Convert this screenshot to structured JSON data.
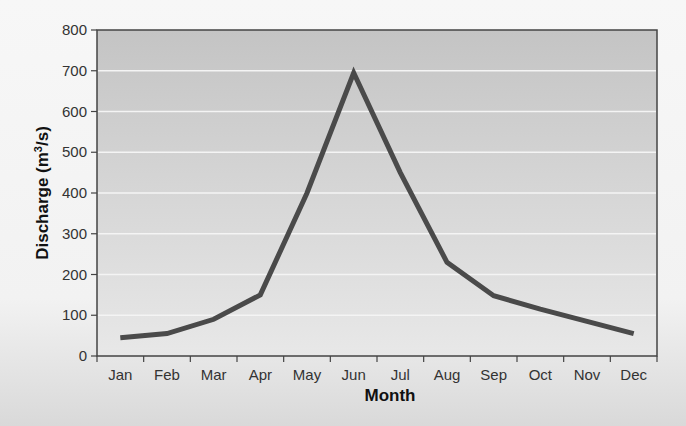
{
  "chart_data": {
    "type": "line",
    "title": "",
    "xlabel": "Month",
    "ylabel": "Discharge (m³/s)",
    "ylabel_parts": {
      "main": "Discharge (m",
      "sup": "3",
      "tail": "/s)"
    },
    "categories": [
      "Jan",
      "Feb",
      "Mar",
      "Apr",
      "May",
      "Jun",
      "Jul",
      "Aug",
      "Sep",
      "Oct",
      "Nov",
      "Dec"
    ],
    "series": [
      {
        "name": "Discharge",
        "values": [
          45,
          55,
          90,
          150,
          400,
          695,
          450,
          230,
          148,
          115,
          85,
          55
        ],
        "color": "#4a4a4a"
      }
    ],
    "ylim": [
      0,
      800
    ],
    "yticks": [
      0,
      100,
      200,
      300,
      400,
      500,
      600,
      700,
      800
    ],
    "grid": true,
    "legend": "none"
  },
  "colors": {
    "plot_background_top": "#c4c4c4",
    "plot_background_bottom": "#e8e8e8",
    "gridline": "#f4f4f4",
    "line": "#4a4a4a",
    "axis": "#444444"
  }
}
